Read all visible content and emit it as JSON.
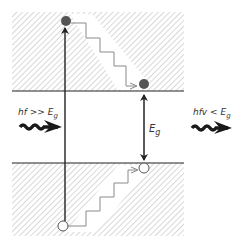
{
  "diagram": {
    "colors": {
      "hatch": "#c9c9c9",
      "line": "#222222",
      "stair": "#8a8a8a",
      "electron": "#555555",
      "hole_fill": "#ffffff",
      "photon": "#1a1a1a"
    },
    "bands": [
      {
        "name": "conduction-band",
        "edge": "bottom"
      },
      {
        "name": "valence-band",
        "edge": "top"
      }
    ],
    "labels": {
      "incoming_photon": "hf >> Eg",
      "incoming_photon_main": "hf >> E",
      "incoming_photon_sub": "g",
      "emitted_photon_main": "hfv < E",
      "emitted_photon_sub": "g",
      "gap_main": "E",
      "gap_sub": "g"
    },
    "particles": [
      {
        "type": "electron",
        "state": "excited",
        "fill": "filled"
      },
      {
        "type": "electron",
        "state": "relaxed",
        "fill": "filled"
      },
      {
        "type": "hole",
        "state": "relaxed",
        "fill": "open"
      },
      {
        "type": "hole",
        "state": "excited",
        "fill": "open"
      }
    ]
  }
}
